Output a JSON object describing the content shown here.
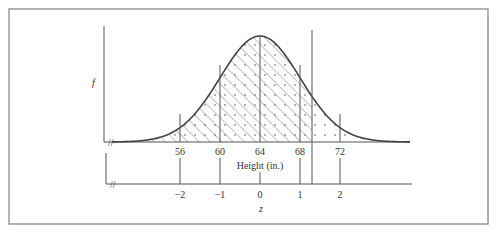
{
  "figure": {
    "y_axis_label": "f",
    "x_axis_label": "Height (in.)",
    "z_axis_label": "z",
    "height_ticks": [
      "56",
      "60",
      "64",
      "68",
      "72"
    ],
    "z_ticks": [
      "−2",
      "−1",
      "0",
      "1",
      "2"
    ],
    "break_mark": "//"
  },
  "chart_data": {
    "type": "line",
    "title": "",
    "distribution": {
      "mean": 64,
      "sd": 4
    },
    "xlabel": "Height (in.)",
    "ylabel": "f",
    "secondary_xlabel": "z",
    "x_ticks": [
      56,
      60,
      64,
      68,
      72
    ],
    "z_ticks": [
      -2,
      -1,
      0,
      1,
      2
    ],
    "xlim": [
      42,
      80
    ],
    "marked_lines_x": [
      56,
      60,
      64,
      68,
      69.2,
      72
    ],
    "hatched_region": {
      "from": "-inf",
      "to_z": 1.3
    },
    "dotted_region": {
      "from": "-inf",
      "to_z": 2.6
    },
    "grid": false,
    "legend": "none"
  }
}
